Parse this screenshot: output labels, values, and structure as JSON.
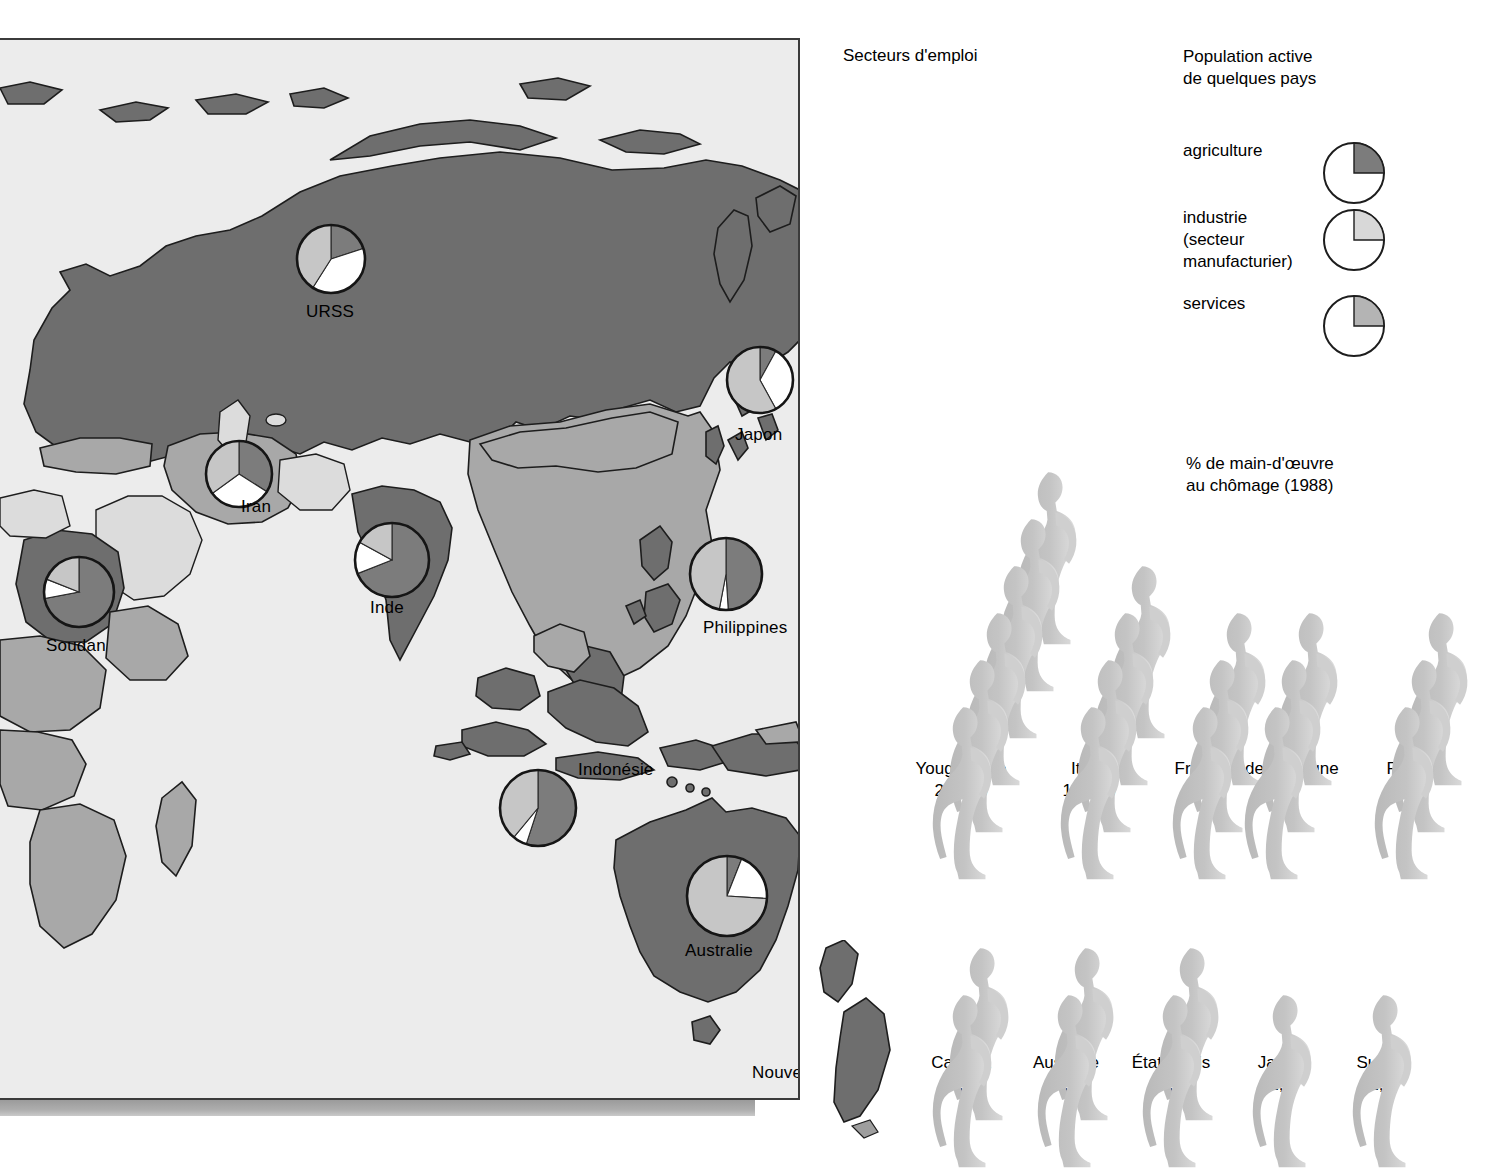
{
  "titles": {
    "sectors": "Secteurs d'emploi",
    "population": "Population active\nde quelques pays",
    "unemployment": "% de main-d'œuvre\nau chômage (1988)"
  },
  "legend": {
    "items": [
      {
        "label": "agriculture",
        "key": "agriculture",
        "color": "#7c7c7c"
      },
      {
        "label": "industrie\n(secteur\nmanufacturier)",
        "key": "industrie",
        "color": "#d8d8d8"
      },
      {
        "label": "services",
        "key": "services",
        "color": "#b4b4b4"
      }
    ]
  },
  "colors": {
    "agriculture": "#7c7c7c",
    "industrie": "#ffffff",
    "services": "#c6c6c6",
    "legend_agriculture": "#7c7c7c",
    "legend_industrie": "#d8d8d8",
    "legend_services": "#b4b4b4",
    "map_ocean": "#ececec",
    "land_dark": "#6e6e6e",
    "land_mid": "#a8a8a8",
    "land_light": "#dcdcdc",
    "figure_fill": "#bdbdbd",
    "figure_highlight": "#e8e8e8",
    "outline": "#1d1d1d"
  },
  "chart_data": {
    "type": "pie",
    "title": "Secteurs d'emploi",
    "legend_position": "top-right",
    "series_names": [
      "agriculture",
      "industrie",
      "services"
    ],
    "countries": [
      {
        "name": "URSS",
        "agriculture": 20,
        "industrie": 39,
        "services": 41,
        "cx": 331,
        "cy": 219,
        "r": 34,
        "label_x": 306,
        "label_y": 262
      },
      {
        "name": "Japon",
        "agriculture": 8,
        "industrie": 34,
        "services": 58,
        "cx": 760,
        "cy": 340,
        "r": 33,
        "label_x": 735,
        "label_y": 385
      },
      {
        "name": "Iran",
        "agriculture": 34,
        "industrie": 31,
        "services": 35,
        "cx": 239,
        "cy": 434,
        "r": 33,
        "label_x": 241,
        "label_y": 457
      },
      {
        "name": "Inde",
        "agriculture": 69,
        "industrie": 14,
        "services": 17,
        "cx": 392,
        "cy": 520,
        "r": 37,
        "label_x": 370,
        "label_y": 558
      },
      {
        "name": "Philippines",
        "agriculture": 49,
        "industrie": 4,
        "services": 47,
        "cx": 726,
        "cy": 534,
        "r": 36,
        "label_x": 703,
        "label_y": 578
      },
      {
        "name": "Soudan",
        "agriculture": 72,
        "industrie": 9,
        "services": 19,
        "cx": 79,
        "cy": 552,
        "r": 35,
        "label_x": 46,
        "label_y": 596
      },
      {
        "name": "Indonésie",
        "agriculture": 55,
        "industrie": 6,
        "services": 39,
        "cx": 538,
        "cy": 768,
        "r": 38,
        "label_x": 578,
        "label_y": 720
      },
      {
        "name": "Australie",
        "agriculture": 6,
        "industrie": 20,
        "services": 74,
        "cx": 727,
        "cy": 856,
        "r": 40,
        "label_x": 685,
        "label_y": 901
      },
      {
        "name": "Nouvelle-Zélande",
        "agriculture": 10,
        "industrie": 26,
        "services": 64,
        "cx": 858,
        "cy": 987,
        "r": 36,
        "label_x": 752,
        "label_y": 1023
      }
    ]
  },
  "unemployment": {
    "title": "% de main-d'œuvre au chômage (1988)",
    "unit": "%",
    "rows": [
      {
        "entries": [
          {
            "country": "Yougoslavie",
            "value": "20,6 %",
            "figures": 6,
            "x": 930,
            "w": 110
          },
          {
            "country": "Italie",
            "value": "14,8 %",
            "figures": 4,
            "x": 1058,
            "w": 90
          },
          {
            "country": "France",
            "value": "10,4",
            "figures": 3,
            "x": 1170,
            "w": 80
          },
          {
            "country": "Grande-Bretagne",
            "value": "9,4",
            "figures": 3,
            "x": 1242,
            "w": 150
          },
          {
            "country": "RFA",
            "value": "9,0",
            "figures": 3,
            "x": 1372,
            "w": 70
          }
        ]
      },
      {
        "entries": [
          {
            "country": "Canada",
            "value": "8,1",
            "figures": 2,
            "x": 930,
            "w": 100
          },
          {
            "country": "Australie",
            "value": "7,8",
            "figures": 2,
            "x": 1035,
            "w": 100
          },
          {
            "country": "États-Unis",
            "value": "5,8",
            "figures": 2,
            "x": 1140,
            "w": 110
          },
          {
            "country": "Japon",
            "value": "2,7",
            "figures": 1,
            "x": 1250,
            "w": 90
          },
          {
            "country": "Suède",
            "value": "1,6",
            "figures": 1,
            "x": 1350,
            "w": 90
          }
        ]
      }
    ]
  }
}
